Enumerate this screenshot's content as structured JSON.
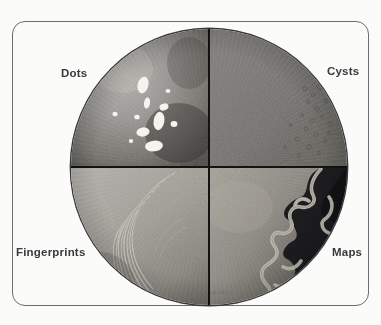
{
  "figure": {
    "credit": "NEI/NIH"
  },
  "labels": {
    "top_left": "Dots",
    "top_right": "Cysts",
    "bottom_left": "Fingerprints",
    "bottom_right": "Maps"
  },
  "quadrants": [
    {
      "id": "dots",
      "label": "Dots",
      "position": "top-left",
      "description": "Irregular bright white opacities scattered on a mottled gray background",
      "base_color": "#8e8e8e",
      "feature_color": "#f4f3ee",
      "feature_count": 11
    },
    {
      "id": "cysts",
      "label": "Cysts",
      "position": "top-right",
      "description": "Uniform medium gray field with faint micro-cystic bubbles near the periphery",
      "base_color": "#7c7c7c",
      "feature_color": "#5f5f5f",
      "feature_count": 40
    },
    {
      "id": "fingerprints",
      "label": "Fingerprints",
      "position": "bottom-left",
      "description": "Curved concentric parallel ridge lines resembling a fingerprint",
      "base_color": "#a7a49e",
      "feature_color": "#cfccc4",
      "feature_count": 12
    },
    {
      "id": "maps",
      "label": "Maps",
      "position": "bottom-right",
      "description": "Dark zone bounded by a light serpentine map-like border",
      "base_color": "#171718",
      "feature_color": "#b9b6ab",
      "feature_count": 1
    }
  ],
  "colors": {
    "plate_background": "#fcfcfb",
    "plate_border": "#6e6e70",
    "divider": "#131314",
    "label_text": "#3b3b3d"
  }
}
